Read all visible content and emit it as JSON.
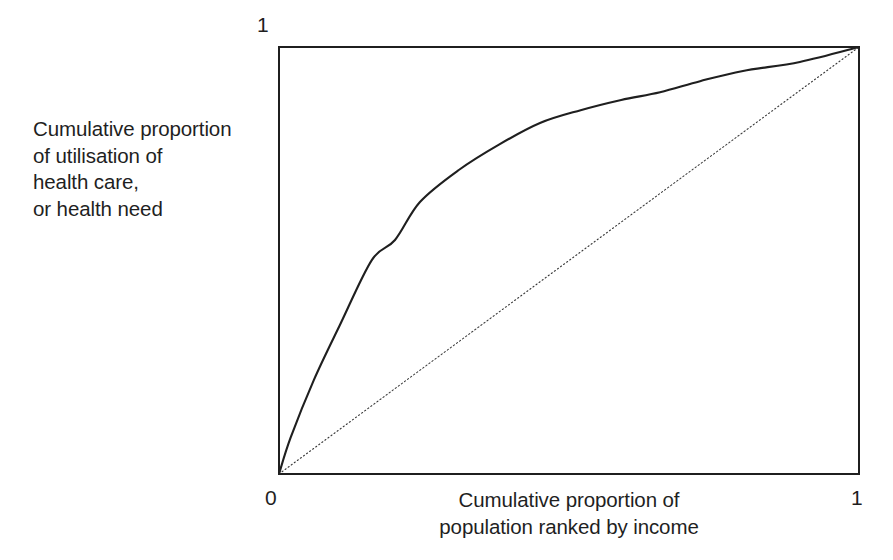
{
  "figure": {
    "background_color": "#ffffff",
    "ink_color": "#1f1f1f"
  },
  "ylabel_text": "Cumulative proportion\nof utilisation of\nhealth care,\nor health need",
  "xlabel_text": "Cumulative proportion of\npopulation ranked by income",
  "ticks": {
    "y_top": "1",
    "x_zero": "0",
    "x_one": "1"
  },
  "chart_data": {
    "type": "line",
    "title": "",
    "subtitle": "",
    "xlabel": "Cumulative proportion of population ranked by income",
    "ylabel": "Cumulative proportion of utilisation of health care, or health need",
    "xlim": [
      0,
      1
    ],
    "ylim": [
      0,
      1
    ],
    "xticks": [
      "0",
      "1"
    ],
    "yticks": [
      "1"
    ],
    "grid": false,
    "legend": "none",
    "frame": "full-box",
    "annotations": [],
    "series": [
      {
        "name": "concentration curve",
        "style": "solid",
        "color": "#1f1f1f",
        "linewidth": 2.1,
        "x": [
          0.0,
          0.02,
          0.06,
          0.105,
          0.16,
          0.2,
          0.243,
          0.31,
          0.38,
          0.45,
          0.52,
          0.59,
          0.657,
          0.726,
          0.8,
          0.898,
          1.0
        ],
        "y": [
          0.0,
          0.085,
          0.22,
          0.349,
          0.501,
          0.548,
          0.637,
          0.712,
          0.772,
          0.822,
          0.852,
          0.876,
          0.894,
          0.92,
          0.944,
          0.965,
          1.0
        ]
      },
      {
        "name": "line of equality",
        "style": "dotted",
        "color": "#3a3a3a",
        "linewidth": 1.1,
        "x": [
          0.0,
          1.0
        ],
        "y": [
          0.0,
          1.0
        ]
      }
    ]
  },
  "plot_box_px": {
    "left": 279,
    "top": 47,
    "right": 859,
    "bottom": 474
  }
}
